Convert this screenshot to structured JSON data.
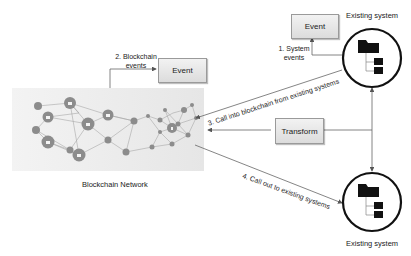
{
  "diagram": {
    "network": {
      "label": "Blockchain Network"
    },
    "boxes": {
      "event_blockchain": "Event",
      "event_system": "Event",
      "transform": "Transform"
    },
    "systems": {
      "top": {
        "label": "Existing system"
      },
      "bottom": {
        "label": "Existing system"
      }
    },
    "edges": {
      "blockchain_events": [
        "2. Blockchain",
        "events"
      ],
      "system_events": [
        "1. System",
        "events"
      ],
      "call_into": "3. Call into blockchain from existing systems",
      "call_out": "4. Call out to existing systems"
    },
    "colors": {
      "network_bg": "#ebebeb",
      "node": "#8c8c8c",
      "edge": "#7a7a7a",
      "circle_stroke": "#111111",
      "folder": "#111111"
    }
  }
}
